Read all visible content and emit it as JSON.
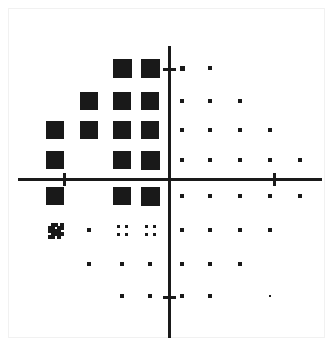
{
  "figure": {
    "title": "",
    "background_color": "#ffffff",
    "frame_color": "#f1f1f1",
    "marker_color": "#191919",
    "axis_color": "#1a1a1a",
    "width": 334,
    "height": 348
  },
  "chart_data": {
    "type": "scatter",
    "title": "",
    "subtitle": "",
    "xlabel": "",
    "ylabel": "",
    "grid": false,
    "legend": "none",
    "description": "Hinton-style grid diagram: marker area encodes magnitude on a Cartesian plane with four quadrants. Large filled squares occupy the upper-left quadrant in a triangular envelope; small dots fill the remaining quadrants.",
    "axes": {
      "origin_px": [
        168,
        178
      ],
      "x_axis": {
        "from_px": 18,
        "to_px": 322,
        "y_px": 178
      },
      "y_axis": {
        "from_px": 46,
        "to_px": 338,
        "x_px": 168
      },
      "xlim": [
        -5,
        5
      ],
      "ylim": [
        -4,
        4
      ],
      "x_ticks": [
        -3,
        3
      ],
      "y_ticks": [
        3,
        -3
      ],
      "x_tick_px": [
        63,
        273
      ],
      "y_tick_px": [
        68,
        296
      ],
      "tick_labels_visible": false
    },
    "grid_columns_px": [
      55,
      89,
      122,
      150,
      182,
      210,
      240,
      270,
      300
    ],
    "grid_rows_px": [
      68,
      101,
      130,
      160,
      196,
      230,
      264,
      296
    ],
    "marker_sizes": {
      "large_square": 19,
      "medium_square": 17,
      "dot": 4,
      "cluster_dot": 3
    },
    "points": [
      {
        "col": 2,
        "row": 0,
        "size": 19,
        "shape": "square"
      },
      {
        "col": 3,
        "row": 0,
        "size": 19,
        "shape": "square"
      },
      {
        "col": 4,
        "row": 0,
        "size": 5,
        "shape": "dot"
      },
      {
        "col": 5,
        "row": 0,
        "size": 4,
        "shape": "dot"
      },
      {
        "col": 1,
        "row": 1,
        "size": 18,
        "shape": "square"
      },
      {
        "col": 2,
        "row": 1,
        "size": 18,
        "shape": "square"
      },
      {
        "col": 3,
        "row": 1,
        "size": 18,
        "shape": "square"
      },
      {
        "col": 4,
        "row": 1,
        "size": 4,
        "shape": "dot"
      },
      {
        "col": 5,
        "row": 1,
        "size": 4,
        "shape": "dot"
      },
      {
        "col": 6,
        "row": 1,
        "size": 4,
        "shape": "dot"
      },
      {
        "col": 0,
        "row": 2,
        "size": 18,
        "shape": "square"
      },
      {
        "col": 1,
        "row": 2,
        "size": 18,
        "shape": "square"
      },
      {
        "col": 2,
        "row": 2,
        "size": 18,
        "shape": "square"
      },
      {
        "col": 3,
        "row": 2,
        "size": 18,
        "shape": "square"
      },
      {
        "col": 4,
        "row": 2,
        "size": 4,
        "shape": "dot"
      },
      {
        "col": 5,
        "row": 2,
        "size": 4,
        "shape": "dot"
      },
      {
        "col": 6,
        "row": 2,
        "size": 4,
        "shape": "dot"
      },
      {
        "col": 7,
        "row": 2,
        "size": 4,
        "shape": "dot"
      },
      {
        "col": 0,
        "row": 3,
        "size": 18,
        "shape": "square"
      },
      {
        "col": 2,
        "row": 3,
        "size": 18,
        "shape": "square"
      },
      {
        "col": 3,
        "row": 3,
        "size": 19,
        "shape": "square"
      },
      {
        "col": 4,
        "row": 3,
        "size": 4,
        "shape": "dot"
      },
      {
        "col": 5,
        "row": 3,
        "size": 4,
        "shape": "dot"
      },
      {
        "col": 6,
        "row": 3,
        "size": 4,
        "shape": "dot"
      },
      {
        "col": 7,
        "row": 3,
        "size": 4,
        "shape": "dot"
      },
      {
        "col": 8,
        "row": 3,
        "size": 4,
        "shape": "dot"
      },
      {
        "col": 0,
        "row": 4,
        "size": 18,
        "shape": "square"
      },
      {
        "col": 2,
        "row": 4,
        "size": 18,
        "shape": "square"
      },
      {
        "col": 3,
        "row": 4,
        "size": 19,
        "shape": "square"
      },
      {
        "col": 4,
        "row": 4,
        "size": 4,
        "shape": "dot"
      },
      {
        "col": 5,
        "row": 4,
        "size": 4,
        "shape": "dot"
      },
      {
        "col": 6,
        "row": 4,
        "size": 4,
        "shape": "dot"
      },
      {
        "col": 7,
        "row": 4,
        "size": 4,
        "shape": "dot"
      },
      {
        "col": 8,
        "row": 4,
        "size": 4,
        "shape": "dot"
      },
      {
        "col": 0,
        "row": 5,
        "size": 15,
        "shape": "blob"
      },
      {
        "col": 1,
        "row": 5,
        "size": 4,
        "shape": "dot"
      },
      {
        "col": 2,
        "row": 5,
        "size": 11,
        "shape": "cluster"
      },
      {
        "col": 3,
        "row": 5,
        "size": 11,
        "shape": "cluster"
      },
      {
        "col": 4,
        "row": 5,
        "size": 4,
        "shape": "dot"
      },
      {
        "col": 5,
        "row": 5,
        "size": 4,
        "shape": "dot"
      },
      {
        "col": 6,
        "row": 5,
        "size": 4,
        "shape": "dot"
      },
      {
        "col": 7,
        "row": 5,
        "size": 4,
        "shape": "dot"
      },
      {
        "col": 1,
        "row": 6,
        "size": 4,
        "shape": "dot"
      },
      {
        "col": 2,
        "row": 6,
        "size": 4,
        "shape": "dot"
      },
      {
        "col": 3,
        "row": 6,
        "size": 4,
        "shape": "dot"
      },
      {
        "col": 4,
        "row": 6,
        "size": 4,
        "shape": "dot"
      },
      {
        "col": 5,
        "row": 6,
        "size": 4,
        "shape": "dot"
      },
      {
        "col": 6,
        "row": 6,
        "size": 4,
        "shape": "dot"
      },
      {
        "col": 2,
        "row": 7,
        "size": 4,
        "shape": "dot"
      },
      {
        "col": 3,
        "row": 7,
        "size": 4,
        "shape": "dot"
      },
      {
        "col": 4,
        "row": 7,
        "size": 4,
        "shape": "dot"
      },
      {
        "col": 5,
        "row": 7,
        "size": 4,
        "shape": "dot"
      },
      {
        "col": 7,
        "row": 7,
        "size": 2,
        "shape": "dot"
      }
    ]
  }
}
